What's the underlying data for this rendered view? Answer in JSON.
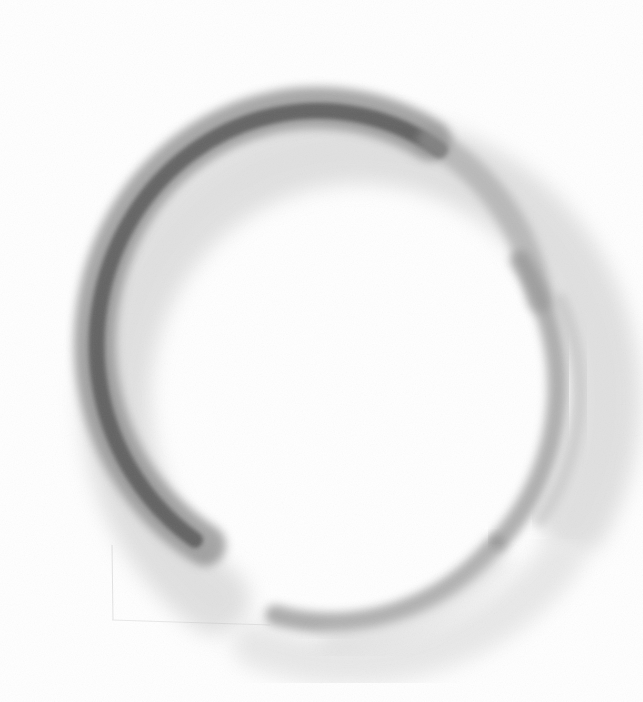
{
  "artwork": {
    "subject": "pencil-sketched enso circle",
    "background_color": "#ffffff",
    "stroke_color_dark": "#3a3a3a",
    "stroke_color_mid": "#7a7a7a",
    "stroke_color_light": "#bdbdbd",
    "circle": {
      "cx": 335,
      "cy": 375,
      "r": 215
    },
    "gap_position": "bottom-left"
  }
}
